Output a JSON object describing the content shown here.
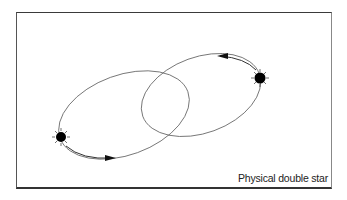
{
  "caption": "Physical double star",
  "diagram": {
    "stars": [
      {
        "name": "left-star",
        "cx": 61,
        "cy": 137
      },
      {
        "name": "right-star",
        "cx": 260,
        "cy": 78
      }
    ],
    "orbits": [
      {
        "name": "left-orbit",
        "cx": 124,
        "cy": 115,
        "rx": 68,
        "ry": 40,
        "rotation": -20
      },
      {
        "name": "right-orbit",
        "cx": 201,
        "cy": 95,
        "rx": 62,
        "ry": 38,
        "rotation": -20
      }
    ],
    "arrows": [
      {
        "name": "orbit-direction-arrow-bottom",
        "x": 110,
        "y": 158,
        "direction": "right"
      },
      {
        "name": "orbit-direction-arrow-top",
        "x": 222,
        "y": 56,
        "direction": "left"
      }
    ],
    "colors": {
      "line": "#555555",
      "star": "#000000",
      "frame": "#333333"
    }
  }
}
